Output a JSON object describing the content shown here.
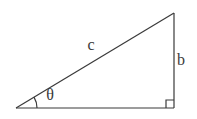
{
  "figure": {
    "type": "right-triangle-diagram",
    "background": "#ffffff",
    "canvas": {
      "width": 197,
      "height": 119
    },
    "stroke": {
      "color": "#3a3a3a",
      "width": 1.2
    },
    "vertices": {
      "angle": {
        "x": 16,
        "y": 108
      },
      "right_angle": {
        "x": 174,
        "y": 108
      },
      "apex": {
        "x": 174,
        "y": 13
      }
    },
    "labels": {
      "hypotenuse": {
        "text": "c",
        "x": 91,
        "y": 50
      },
      "opposite": {
        "text": "b",
        "x": 181,
        "y": 65
      },
      "angle": {
        "text": "θ",
        "x": 50,
        "y": 100
      }
    },
    "angle_arc": {
      "radius": 21
    },
    "right_angle_marker": {
      "size": 8
    },
    "label_font_size": 16
  }
}
